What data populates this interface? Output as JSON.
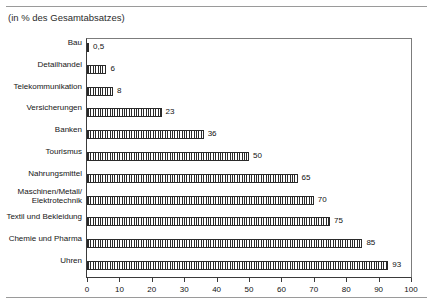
{
  "page": {
    "top_cut_text": "",
    "subtitle": "(in % des Gesamtabsatzes)"
  },
  "chart_data": {
    "type": "bar",
    "orientation": "horizontal",
    "title": "",
    "subtitle": "(in % des Gesamtabsatzes)",
    "xlabel": "",
    "ylabel": "",
    "xlim": [
      0,
      100
    ],
    "xticks": [
      0,
      10,
      20,
      30,
      40,
      50,
      60,
      70,
      80,
      90,
      100
    ],
    "xtick_labels": [
      "0",
      "10",
      "20",
      "30",
      "40",
      "50",
      "60",
      "70",
      "80",
      "90",
      "100"
    ],
    "grid": false,
    "legend": false,
    "categories": [
      "Bau",
      "Detailhandel",
      "Telekommunikation",
      "Versicherungen",
      "Banken",
      "Tourismus",
      "Nahrungsmittel",
      "Maschinen/Metall/\nElektrotechnik",
      "Textil und Bekleidung",
      "Chemie und Pharma",
      "Uhren"
    ],
    "values": [
      0.5,
      6,
      8,
      23,
      36,
      50,
      65,
      70,
      75,
      85,
      93
    ],
    "value_labels": [
      "0,5",
      "6",
      "8",
      "23",
      "36",
      "50",
      "65",
      "70",
      "75",
      "85",
      "93"
    ],
    "colors": {
      "bar_fill": "#ffffff",
      "bar_hatch": "#2a2a2a",
      "bar_edge": "#2a2a2a",
      "axis": "#3a3a3a",
      "frame": "#7c7c7c",
      "text": "#111111",
      "rule": "#9a9a9a"
    }
  }
}
